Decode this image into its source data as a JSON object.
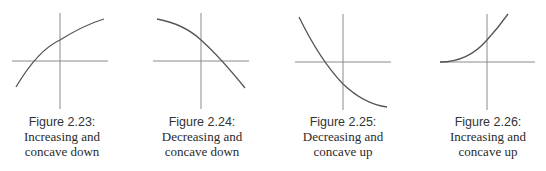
{
  "figures": [
    {
      "label": "Figure 2.23:",
      "line1": "Increasing and",
      "line2": "concave down",
      "axis_center": [
        60,
        61
      ],
      "curve": "M16,87 Q38,50 60,40 Q84,25 104,19"
    },
    {
      "label": "Figure 2.24:",
      "line1": "Decreasing and",
      "line2": "concave down",
      "axis_center": [
        201,
        61
      ],
      "curve": "M157,19 Q184,24 201,40 Q220,57 245,88"
    },
    {
      "label": "Figure 2.25:",
      "line1": "Decreasing and",
      "line2": "concave up",
      "axis_center": [
        343,
        62
      ],
      "curve": "M299,17 Q320,60 343,84 Q364,104 387,107"
    },
    {
      "label": "Figure 2.26:",
      "line1": "Increasing and",
      "line2": "concave up",
      "axis_center": [
        487,
        62
      ],
      "curve": "M440,62 Q468,62 487,40 Q498,28 508,14"
    }
  ],
  "colors": {
    "axis": "#8a8a8a",
    "curve": "#555555",
    "text": "#2b2b2b"
  }
}
